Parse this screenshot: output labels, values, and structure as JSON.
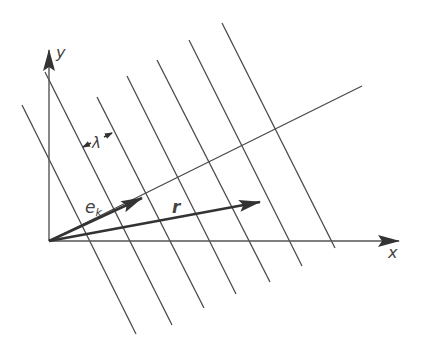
{
  "diagram": {
    "colors": {
      "stroke": "#4a4a4a",
      "arrow": "#333333",
      "background": "#ffffff"
    },
    "labels": {
      "y_axis": "y",
      "x_axis": "x",
      "unit_vector_main": "e",
      "unit_vector_sub": "k",
      "position_vector": "r",
      "wavelength": "λ"
    },
    "wavefronts": [
      {
        "x1": 22,
        "y1": 105,
        "x2": 136,
        "y2": 334
      },
      {
        "x1": 45,
        "y1": 72,
        "x2": 172,
        "y2": 325
      },
      {
        "x1": 97,
        "y1": 97,
        "x2": 204,
        "y2": 308
      },
      {
        "x1": 127,
        "y1": 76,
        "x2": 236,
        "y2": 294
      },
      {
        "x1": 157,
        "y1": 60,
        "x2": 270,
        "y2": 282
      },
      {
        "x1": 189,
        "y1": 40,
        "x2": 302,
        "y2": 266
      },
      {
        "x1": 222,
        "y1": 23,
        "x2": 335,
        "y2": 248
      }
    ]
  }
}
